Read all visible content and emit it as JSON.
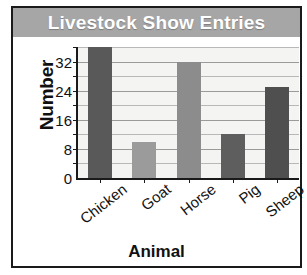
{
  "chart_data": {
    "type": "bar",
    "title": "Livestock Show Entries",
    "xlabel": "Animal",
    "ylabel": "Number",
    "categories": [
      "Chicken",
      "Goat",
      "Horse",
      "Pig",
      "Sheep"
    ],
    "values": [
      36,
      10,
      32,
      12,
      25
    ],
    "bar_colors": [
      "#595959",
      "#9b9b9b",
      "#8c8c8c",
      "#5e5e5e",
      "#4f4f4f"
    ],
    "ylim": [
      0,
      36
    ],
    "ytick_labels": [
      "0",
      "8",
      "16",
      "24",
      "32"
    ],
    "ytick_values": [
      0,
      8,
      16,
      24,
      32
    ],
    "gridline_values": [
      4,
      8,
      12,
      16,
      20,
      24,
      28,
      32,
      36
    ],
    "grid": true,
    "legend": "none",
    "plot_background": "#f4f4f2",
    "title_banner_color": "#a6a6a6",
    "title_text_color": "#ffffff",
    "frame_color": "#1a1a1a"
  }
}
